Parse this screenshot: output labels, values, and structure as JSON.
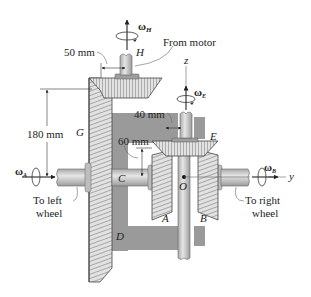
{
  "figure": {
    "type": "mechanical-diagram"
  },
  "labels": {
    "omega_H": "ω",
    "omega_H_sub": "H",
    "from_motor": "From motor",
    "dim_50": "50 mm",
    "H": "H",
    "z_axis": "z",
    "omega_E": "ω",
    "omega_E_sub": "E",
    "dim_180": "180 mm",
    "G": "G",
    "dim_40": "40 mm",
    "E": "E",
    "dim_60": "60 mm",
    "omega_A": "ω",
    "omega_A_sub": "A",
    "C": "C",
    "O": "O",
    "omega_B": "ω",
    "omega_B_sub": "B",
    "y_axis": "y",
    "to_left_wheel_1": "To left",
    "to_left_wheel_2": "wheel",
    "to_right_wheel_1": "To right",
    "to_right_wheel_2": "wheel",
    "A": "A",
    "B": "B",
    "D": "D"
  },
  "colors": {
    "gear_face": "#d9d9d9",
    "gear_dark": "#7a7a7a",
    "frame": "#9a9a9a",
    "shaft": "#c8c8c8",
    "line": "#222222"
  }
}
